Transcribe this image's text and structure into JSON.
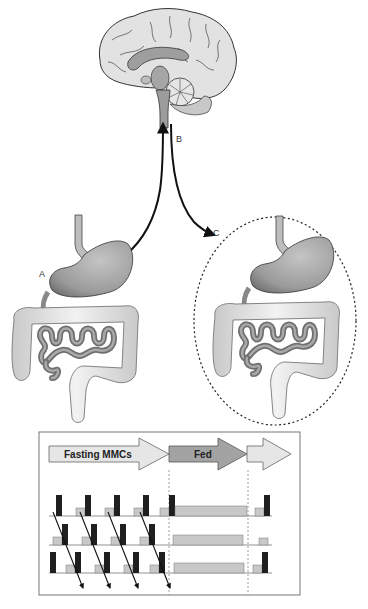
{
  "diagram": {
    "labels": {
      "a": "A",
      "b": "B",
      "c": "C"
    },
    "mmc_chart": {
      "phases": [
        {
          "label": "Fasting MMCs",
          "fill": "#e6e6e6"
        },
        {
          "label": "Fed",
          "fill": "#a3a3a3"
        },
        {
          "label": "",
          "fill": "#e6e6e6"
        }
      ],
      "rows": 3,
      "bar_dark": "#1f1f1f",
      "bar_light": "#c8c8c8"
    }
  },
  "colors": {
    "organ_fill": "#a8a8a8",
    "intestine_light": "#e3e3e3",
    "intestine_dark": "#7a7a7a",
    "brain_light": "#e0e0e0",
    "brain_dark": "#9a9a9a",
    "line": "#111111"
  }
}
